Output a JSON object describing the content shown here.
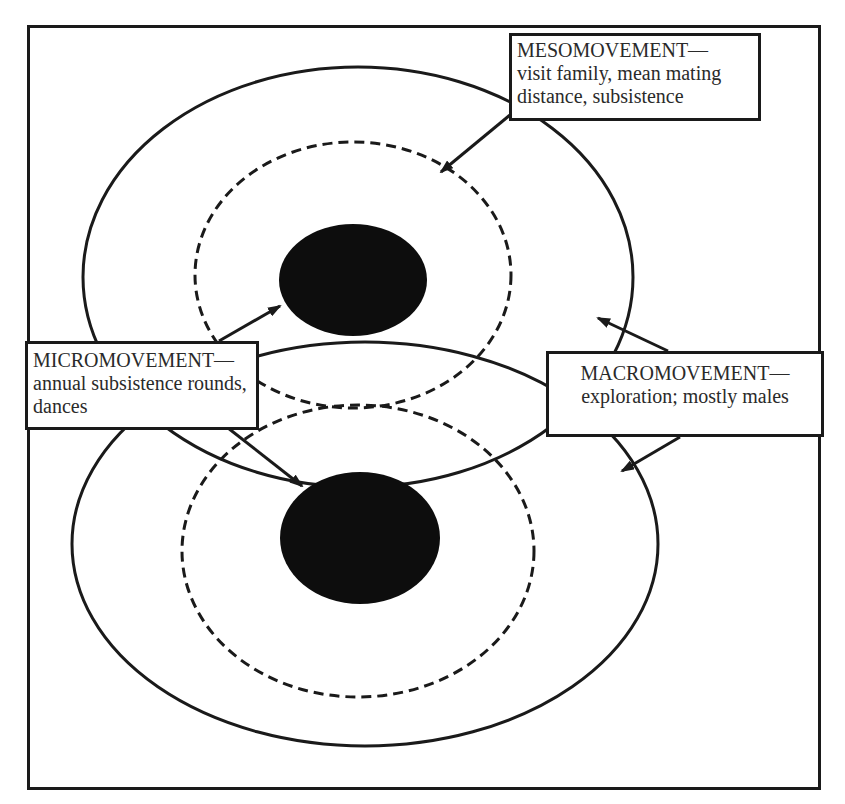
{
  "diagram": {
    "type": "movement-scale-diagram",
    "colors": {
      "stroke": "#1a1a1a",
      "fill_core": "#0d0d0d",
      "background": "#ffffff"
    },
    "labels": {
      "meso": {
        "title": "MESOMOVEMENT—",
        "line1": "visit family, mean mating",
        "line2": "distance, subsistence"
      },
      "micro": {
        "title": "MICROMOVEMENT—",
        "line1": "annual subsistence rounds,",
        "line2": "dances"
      },
      "macro": {
        "title": "MACROMOVEMENT—",
        "line1": "exploration; mostly males"
      }
    },
    "groups": [
      {
        "name": "upper",
        "core": {
          "cx": 353,
          "cy": 280,
          "rx": 74,
          "ry": 56
        },
        "dashed_ring": {
          "cx": 353,
          "cy": 275,
          "rx": 158,
          "ry": 133
        },
        "outer_ring": {
          "cx": 358,
          "cy": 277,
          "rx": 275,
          "ry": 210
        }
      },
      {
        "name": "lower",
        "core": {
          "cx": 360,
          "cy": 538,
          "rx": 80,
          "ry": 66
        },
        "dashed_ring": {
          "cx": 358,
          "cy": 551,
          "rx": 176,
          "ry": 146
        },
        "outer_ring": {
          "cx": 365,
          "cy": 544,
          "rx": 293,
          "ry": 202
        }
      }
    ]
  }
}
